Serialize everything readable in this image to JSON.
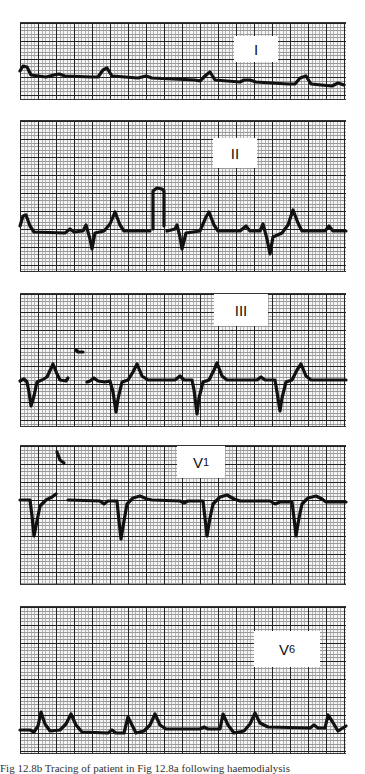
{
  "figure": {
    "caption": "Fig 12.8b    Tracing of patient in Fig 12.8a following haemodialysis",
    "leads": [
      {
        "id": "I",
        "label": "I",
        "subscript": ""
      },
      {
        "id": "II",
        "label": "II",
        "subscript": ""
      },
      {
        "id": "III",
        "label": "III",
        "subscript": ""
      },
      {
        "id": "V1",
        "label": "V",
        "subscript": "1"
      },
      {
        "id": "V6",
        "label": "V",
        "subscript": "6"
      }
    ]
  }
}
